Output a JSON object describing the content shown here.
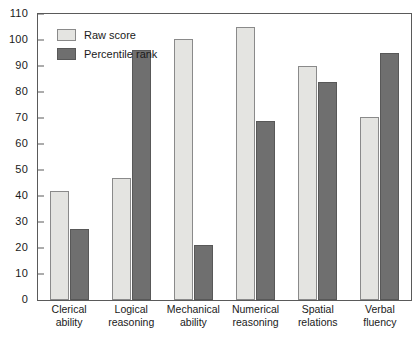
{
  "chart_data": {
    "type": "bar",
    "title": "",
    "xlabel": "",
    "ylabel": "",
    "ylim": [
      0,
      110
    ],
    "ytick_step": 10,
    "yticks": [
      0,
      10,
      20,
      30,
      40,
      50,
      60,
      70,
      80,
      90,
      100,
      110
    ],
    "grid": false,
    "legend_position": "top-left",
    "categories": [
      "Clerical ability",
      "Logical reasoning",
      "Mechanical ability",
      "Numerical reasoning",
      "Spatial relations",
      "Verbal fluency"
    ],
    "category_lines": [
      [
        "Clerical",
        "ability"
      ],
      [
        "Logical",
        "reasoning"
      ],
      [
        "Mechanical",
        "ability"
      ],
      [
        "Numerical",
        "reasoning"
      ],
      [
        "Spatial",
        "relations"
      ],
      [
        "Verbal",
        "fluency"
      ]
    ],
    "series": [
      {
        "name": "Raw score",
        "color": "#e4e4e1",
        "values": [
          42,
          47,
          100.5,
          105,
          90,
          70.5
        ]
      },
      {
        "name": "Percentile rank",
        "color": "#6f6f6f",
        "values": [
          27.5,
          96,
          21,
          69,
          84,
          95
        ]
      }
    ]
  },
  "legend": {
    "items": [
      {
        "label": "Raw score"
      },
      {
        "label": "Percentile rank"
      }
    ]
  }
}
